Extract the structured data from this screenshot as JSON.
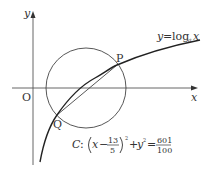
{
  "axes": {
    "x_label": "x",
    "y_label": "y",
    "origin_label": "O"
  },
  "curve": {
    "label_y": "y",
    "label_eq": "=",
    "label_log": "log",
    "label_base": "a",
    "label_x": "x"
  },
  "points": {
    "P": "P",
    "Q": "Q"
  },
  "circle": {
    "name": "C",
    "colon": ":",
    "x_var": "x",
    "minus": "−",
    "h_num": "13",
    "h_den": "5",
    "exp": "2",
    "plus": "+",
    "y_var": "y",
    "equals": "=",
    "r2_num": "601",
    "r2_den": "100"
  },
  "colors": {
    "line": "#333333",
    "axis": "#555555"
  }
}
